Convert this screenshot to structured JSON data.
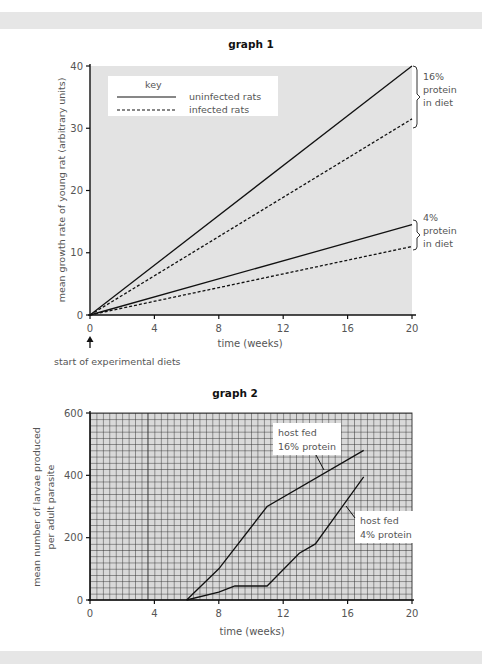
{
  "chart_data": [
    {
      "type": "line",
      "title": "graph 1",
      "xlabel": "time (weeks)",
      "ylabel": "mean growth rate of young rat (arbitrary units)",
      "x_ticks": [
        0,
        4,
        8,
        12,
        16,
        20
      ],
      "y_ticks": [
        0,
        10,
        20,
        30,
        40
      ],
      "xlim": [
        0,
        20
      ],
      "ylim": [
        0,
        40
      ],
      "grid": false,
      "background": "#e3e3e3",
      "legend": {
        "title": "key",
        "position": "upper-left",
        "entries": [
          {
            "label": "uninfected rats",
            "style": "solid"
          },
          {
            "label": "infected rats",
            "style": "dashed"
          }
        ]
      },
      "series": [
        {
          "name": "uninfected rats, 16% protein in diet",
          "style": "solid",
          "x": [
            0,
            20
          ],
          "values": [
            0,
            40
          ]
        },
        {
          "name": "infected rats, 16% protein in diet",
          "style": "dashed",
          "x": [
            0,
            20
          ],
          "values": [
            0,
            31.5
          ]
        },
        {
          "name": "uninfected rats, 4% protein in diet",
          "style": "solid",
          "x": [
            0,
            20
          ],
          "values": [
            0,
            14.5
          ]
        },
        {
          "name": "infected rats, 4% protein in diet",
          "style": "dashed",
          "x": [
            0,
            20
          ],
          "values": [
            0,
            11
          ]
        }
      ],
      "annotations": [
        {
          "text": "16% protein in diet",
          "bracket": "upper pair at x=20"
        },
        {
          "text": "4% protein in diet",
          "bracket": "lower pair at x=20"
        },
        {
          "text": "start of experimental diets",
          "arrow_to_x": 0
        }
      ]
    },
    {
      "type": "line",
      "title": "graph 2",
      "xlabel": "time (weeks)",
      "ylabel": "mean number of larvae produced per adult parasite",
      "x_ticks": [
        0,
        4,
        8,
        12,
        16,
        20
      ],
      "y_ticks": [
        0,
        200,
        400,
        600
      ],
      "xlim": [
        0,
        20
      ],
      "ylim": [
        0,
        600
      ],
      "grid": true,
      "background": "#d9d9d9",
      "series": [
        {
          "name": "host fed 16% protein",
          "x": [
            6,
            8,
            11,
            17
          ],
          "values": [
            0,
            100,
            300,
            480
          ]
        },
        {
          "name": "host fed 4% protein",
          "x": [
            6,
            8,
            9,
            11,
            13,
            14,
            17
          ],
          "values": [
            0,
            25,
            45,
            45,
            150,
            180,
            395
          ]
        }
      ],
      "annotations": [
        {
          "text": "host fed 16% protein"
        },
        {
          "text": "host fed 4% protein"
        }
      ]
    }
  ],
  "graph1": {
    "title": "graph 1",
    "xlabel": "time (weeks)",
    "ylabel": "mean growth rate of young rat (arbitrary units)",
    "x_ticks": [
      "0",
      "4",
      "8",
      "12",
      "16",
      "20"
    ],
    "y_ticks": [
      "0",
      "10",
      "20",
      "30",
      "40"
    ],
    "key_title": "key",
    "key_solid": "uninfected rats",
    "key_dashed": "infected rats",
    "bracket_high": [
      "16%",
      "protein",
      "in diet"
    ],
    "bracket_low": [
      "4%",
      "protein",
      "in diet"
    ],
    "start_note": "start of experimental diets"
  },
  "graph2": {
    "title": "graph 2",
    "xlabel": "time (weeks)",
    "ylabel_line1": "mean number of larvae produced",
    "ylabel_line2": "per adult parasite",
    "x_ticks": [
      "0",
      "4",
      "8",
      "12",
      "16",
      "20"
    ],
    "y_ticks": [
      "0",
      "200",
      "400",
      "600"
    ],
    "label_high": [
      "host fed",
      "16% protein"
    ],
    "label_low": [
      "host fed",
      "4% protein"
    ]
  }
}
